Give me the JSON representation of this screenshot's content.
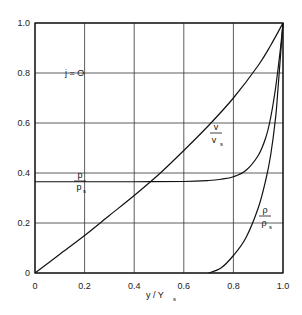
{
  "chart_data": {
    "type": "line",
    "title": "",
    "annotation": "j = O",
    "xlabel": "y / y_s",
    "ylabel": "",
    "xlim": [
      0,
      1.0
    ],
    "ylim": [
      0,
      1.0
    ],
    "grid": true,
    "x_ticks": [
      "0",
      "0.2",
      "0.4",
      "0.6",
      "0.8",
      "1.0"
    ],
    "y_ticks": [
      "0",
      "0.2",
      "0.4",
      "0.6",
      "0.8",
      "1.0"
    ],
    "series": [
      {
        "name": "v / v_s",
        "label_num": "v",
        "label_den": "v",
        "label_sub": "s",
        "x": [
          0,
          0.1,
          0.2,
          0.3,
          0.4,
          0.5,
          0.6,
          0.7,
          0.8,
          0.9,
          0.95,
          1.0
        ],
        "y": [
          0,
          0.075,
          0.15,
          0.23,
          0.31,
          0.395,
          0.49,
          0.59,
          0.7,
          0.83,
          0.91,
          1.0
        ]
      },
      {
        "name": "p / p_s",
        "label_num": "p",
        "label_den": "p",
        "label_sub": "s",
        "x": [
          0,
          0.2,
          0.4,
          0.6,
          0.7,
          0.75,
          0.8,
          0.85,
          0.9,
          0.93,
          0.95,
          0.97,
          0.99,
          1.0
        ],
        "y": [
          0.365,
          0.365,
          0.365,
          0.366,
          0.37,
          0.375,
          0.385,
          0.41,
          0.47,
          0.54,
          0.62,
          0.74,
          0.9,
          1.0
        ]
      },
      {
        "name": "ρ / ρ_s",
        "label_num": "ρ",
        "label_den": "ρ",
        "label_sub": "s",
        "x": [
          0.7,
          0.75,
          0.8,
          0.85,
          0.9,
          0.93,
          0.95,
          0.97,
          0.98,
          0.99,
          1.0
        ],
        "y": [
          0,
          0.02,
          0.07,
          0.14,
          0.26,
          0.37,
          0.47,
          0.62,
          0.74,
          0.87,
          1.0
        ]
      }
    ]
  },
  "labels": {
    "annotation": "j = O",
    "xlabel_main": "y / Y",
    "xlabel_sub": "s"
  }
}
